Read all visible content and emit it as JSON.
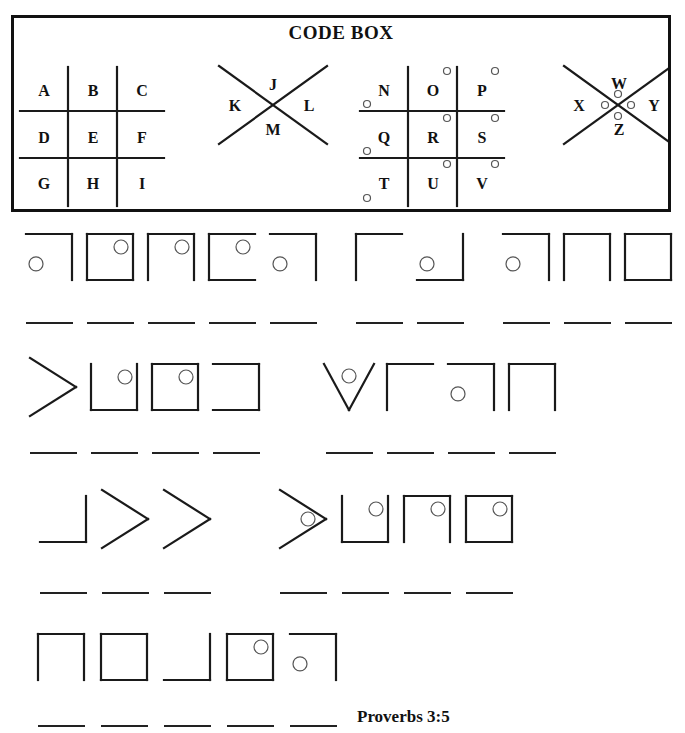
{
  "code_box": {
    "title": "CODE BOX",
    "grid1": {
      "cells": [
        "A",
        "B",
        "C",
        "D",
        "E",
        "F",
        "G",
        "H",
        "I"
      ],
      "dotted": false
    },
    "x1": {
      "top": "J",
      "left": "K",
      "right": "L",
      "bottom": "M",
      "dotted": false
    },
    "grid2": {
      "cells": [
        "N",
        "O",
        "P",
        "Q",
        "R",
        "S",
        "T",
        "U",
        "V"
      ],
      "dotted": true
    },
    "x2": {
      "top": "W",
      "left": "X",
      "right": "Y",
      "bottom": "Z",
      "dotted": true
    }
  },
  "puzzle": {
    "rows": [
      {
        "words": [
          {
            "glyphs": [
              "T",
              "R",
              "U",
              "S",
              "T"
            ]
          },
          {
            "glyphs": [
              "I",
              "N"
            ]
          },
          {
            "glyphs": [
              "T",
              "H",
              "E"
            ]
          }
        ]
      },
      {
        "words": [
          {
            "glyphs": [
              "L",
              "O",
              "R",
              "D"
            ]
          },
          {
            "glyphs": [
              "W",
              "I",
              "T",
              "H"
            ]
          }
        ]
      },
      {
        "words": [
          {
            "glyphs": [
              "A",
              "L",
              "L"
            ]
          },
          {
            "glyphs": [
              "Y",
              "O",
              "U",
              "R"
            ]
          }
        ]
      },
      {
        "words": [
          {
            "glyphs": [
              "H",
              "E",
              "A",
              "R",
              "T"
            ]
          }
        ]
      }
    ]
  },
  "reference": "Proverbs 3:5"
}
